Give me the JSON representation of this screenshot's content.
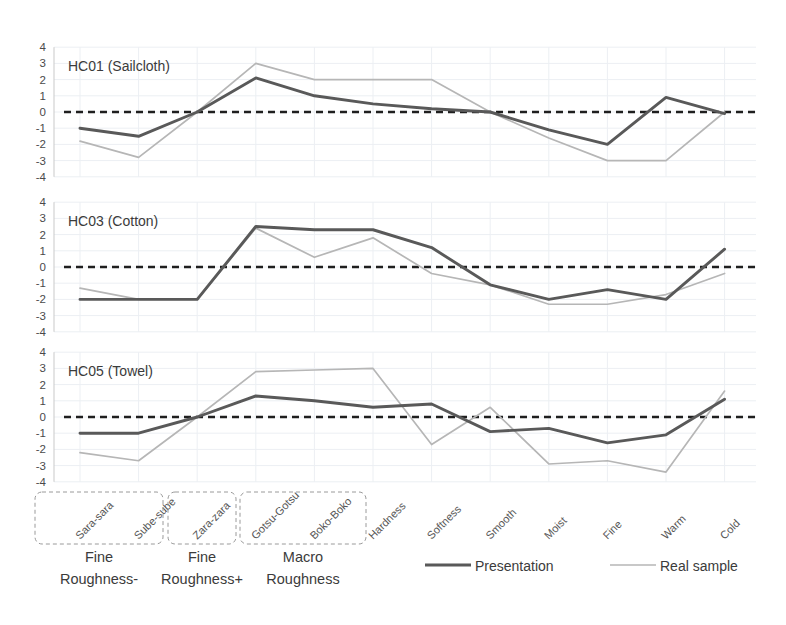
{
  "chart_data": {
    "type": "line",
    "title": "",
    "xlabel": "",
    "ylabel": "",
    "ylim": [
      -4,
      4
    ],
    "yticks": [
      4,
      3,
      2,
      1,
      0,
      -1,
      -2,
      -3,
      -4
    ],
    "grid": true,
    "legend_position": "bottom",
    "categories": [
      "Sara-sara",
      "Sube-sube",
      "Zara-zara",
      "Gotsu-Gotsu",
      "Boko-Boko",
      "Hardness",
      "Softness",
      "Smooth",
      "Moist",
      "Fine",
      "Warm",
      "Cold"
    ],
    "legend": [
      {
        "name": "Presentation",
        "color": "#595959",
        "width": 2.9
      },
      {
        "name": "Real sample",
        "color": "#b6b6b6",
        "width": 1.7
      }
    ],
    "category_groups": [
      {
        "label_line1": "Fine",
        "label_line2": "Roughness-",
        "categories": [
          "Sara-sara",
          "Sube-sube"
        ]
      },
      {
        "label_line1": "Fine",
        "label_line2": "Roughness+",
        "categories": [
          "Zara-zara"
        ]
      },
      {
        "label_line1": "Macro",
        "label_line2": "Roughness",
        "categories": [
          "Gotsu-Gotsu",
          "Boko-Boko"
        ]
      }
    ],
    "panels": [
      {
        "id": "HC01",
        "title": "HC01 (Sailcloth)",
        "series": [
          {
            "name": "Presentation",
            "values": [
              -1.0,
              -1.5,
              0.0,
              2.1,
              1.0,
              0.5,
              0.2,
              0.0,
              -1.1,
              -2.0,
              0.9,
              -0.1
            ]
          },
          {
            "name": "Real sample",
            "values": [
              -1.8,
              -2.8,
              0.0,
              3.0,
              2.0,
              2.0,
              2.0,
              0.0,
              -1.6,
              -3.0,
              -3.0,
              0.0
            ]
          }
        ]
      },
      {
        "id": "HC03",
        "title": "HC03 (Cotton)",
        "series": [
          {
            "name": "Presentation",
            "values": [
              -2.0,
              -2.0,
              -2.0,
              2.5,
              2.3,
              2.3,
              1.2,
              -1.1,
              -2.0,
              -1.4,
              -2.0,
              1.1
            ]
          },
          {
            "name": "Real sample",
            "values": [
              -1.3,
              -2.0,
              -2.0,
              2.4,
              0.6,
              1.8,
              -0.4,
              -1.1,
              -2.3,
              -2.3,
              -1.7,
              -0.4
            ]
          }
        ]
      },
      {
        "id": "HC05",
        "title": "HC05 (Towel)",
        "series": [
          {
            "name": "Presentation",
            "values": [
              -1.0,
              -1.0,
              0.0,
              1.3,
              1.0,
              0.6,
              0.8,
              -0.9,
              -0.7,
              -1.6,
              -1.1,
              1.1
            ]
          },
          {
            "name": "Real sample",
            "values": [
              -2.2,
              -2.7,
              0.0,
              2.8,
              2.9,
              3.0,
              -1.7,
              0.6,
              -2.9,
              -2.7,
              -3.4,
              1.6
            ]
          }
        ]
      }
    ]
  }
}
